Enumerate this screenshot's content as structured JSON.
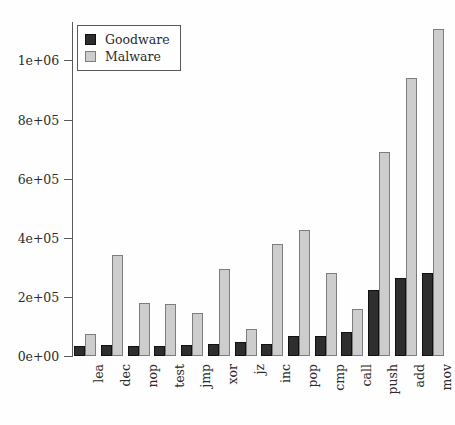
{
  "chart_data": {
    "type": "bar",
    "title": "",
    "subtitle": "",
    "xlabel": "",
    "ylabel": "",
    "grid": false,
    "legend_position": "top-left",
    "categories": [
      "lea",
      "dec",
      "nop",
      "test",
      "jmp",
      "xor",
      "jz",
      "inc",
      "pop",
      "cmp",
      "call",
      "push",
      "add",
      "mov"
    ],
    "series": [
      {
        "name": "Goodware",
        "color": "#2e2e2e",
        "values": [
          35000,
          37000,
          35000,
          35000,
          38000,
          40000,
          48000,
          42000,
          68000,
          68000,
          82000,
          222000,
          265000,
          280000
        ]
      },
      {
        "name": "Malware",
        "color": "#cdcdcd",
        "values": [
          75000,
          343000,
          178000,
          176000,
          145000,
          295000,
          90000,
          378000,
          428000,
          282000,
          160000,
          689000,
          939000,
          1105000
        ]
      }
    ],
    "ylim": [
      0,
      1130000
    ],
    "yticks": [
      0,
      200000,
      400000,
      600000,
      800000,
      1000000
    ],
    "ytick_labels": [
      "0e+00",
      "2e+05",
      "4e+05",
      "6e+05",
      "8e+05",
      "1e+06"
    ]
  },
  "legend": {
    "entries": [
      {
        "label": "Goodware",
        "swatch": "goodware-swatch"
      },
      {
        "label": "Malware",
        "swatch": "malware-swatch"
      }
    ]
  }
}
